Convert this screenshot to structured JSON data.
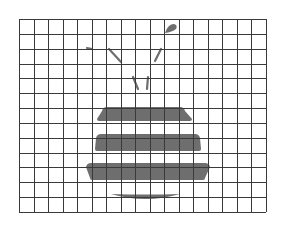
{
  "figure": {
    "background_color": "#ffffff",
    "grid": {
      "left": 19,
      "top": 19,
      "right": 266,
      "bottom": 212,
      "columns": 17,
      "rows": 13,
      "line_color": "#3a3a3a"
    },
    "shape_color": "#6e6e6e",
    "stripes": [
      {
        "y_top": 107,
        "y_bottom": 121,
        "x_left_top": 103,
        "x_left_bottom": 97,
        "x_right_top": 184,
        "x_right_bottom": 192
      },
      {
        "y_top": 134,
        "y_bottom": 151,
        "x_left_top": 97,
        "x_left_bottom": 95,
        "x_right_top": 199,
        "x_right_bottom": 201
      },
      {
        "y_top": 163,
        "y_bottom": 180,
        "x_left_top": 87,
        "x_left_bottom": 90,
        "x_right_top": 209,
        "x_right_bottom": 205
      }
    ],
    "bottom_crescent": {
      "x_left": 111,
      "x_right": 180,
      "y_top": 194,
      "y_bottom": 200
    },
    "antennae": [
      {
        "x1": 109,
        "y1": 49,
        "x2": 121,
        "y2": 62
      },
      {
        "x1": 133,
        "y1": 77,
        "x2": 138,
        "y2": 89
      },
      {
        "x1": 161,
        "y1": 49,
        "x2": 155,
        "y2": 61
      },
      {
        "x1": 148,
        "y1": 77,
        "x2": 147,
        "y2": 89
      }
    ],
    "left_tick": {
      "x1": 87,
      "y1": 48,
      "x2": 92,
      "y2": 49
    },
    "droplet": {
      "cx": 172,
      "cy": 28
    }
  }
}
